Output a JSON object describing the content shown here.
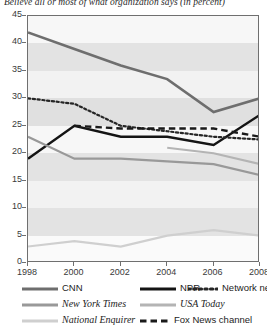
{
  "chart_data": {
    "type": "line",
    "title": "Believe all or most of what organization says (in percent)",
    "xlabel": "",
    "ylabel": "",
    "x": [
      1998,
      2000,
      2002,
      2004,
      2006,
      2008
    ],
    "xticklabels": [
      "1998",
      "2000",
      "2002",
      "2004",
      "2006",
      "2008"
    ],
    "yticklabels": [
      "0",
      "5",
      "10",
      "15",
      "20",
      "25",
      "30",
      "35",
      "40",
      "45"
    ],
    "ylim": [
      0,
      45
    ],
    "ytick_step": 5,
    "grid": "horizontal alternating gray bands",
    "legend_position": "below plot",
    "series": [
      {
        "name": "CNN",
        "color": "#6e6e6e",
        "style": "solid",
        "width": 2.6,
        "x": [
          1998,
          2000,
          2002,
          2004,
          2006,
          2008
        ],
        "values": [
          42,
          39,
          36,
          33.5,
          27.5,
          30
        ]
      },
      {
        "name": "NPR",
        "color": "#141414",
        "style": "solid",
        "width": 2.4,
        "x": [
          1998,
          2000,
          2002,
          2004,
          2006,
          2008
        ],
        "values": [
          19,
          25,
          23,
          23,
          21.5,
          27
        ]
      },
      {
        "name": "Network news",
        "color": "#262626",
        "style": "dotted",
        "width": 2.2,
        "x": [
          1998,
          2000,
          2002,
          2004,
          2006,
          2008
        ],
        "values": [
          30,
          29,
          25,
          24,
          23,
          22.5
        ]
      },
      {
        "name": "New York Times",
        "color": "#999999",
        "style": "solid",
        "width": 2.2,
        "x": [
          1998,
          2000,
          2002,
          2004,
          2006,
          2008
        ],
        "values": [
          23,
          19,
          19,
          18.5,
          18,
          16
        ]
      },
      {
        "name": "USA Today",
        "color": "#b4b4b4",
        "style": "solid",
        "width": 2.2,
        "x": [
          2004,
          2006,
          2008
        ],
        "values": [
          21,
          20,
          18
        ]
      },
      {
        "name": "National Enquirer",
        "color": "#cfcfcf",
        "style": "solid",
        "width": 2.2,
        "x": [
          1998,
          2000,
          2002,
          2004,
          2006,
          2008
        ],
        "values": [
          3,
          4,
          3,
          5,
          6,
          5
        ]
      },
      {
        "name": "Fox News channel",
        "color": "#1a1a1a",
        "style": "dashed",
        "width": 2.4,
        "x": [
          2000,
          2002,
          2004,
          2006,
          2008
        ],
        "values": [
          25,
          24.5,
          24.5,
          24.5,
          23
        ]
      }
    ],
    "bands": [
      {
        "from": 0,
        "to": 5,
        "shade": "#fafafa"
      },
      {
        "from": 5,
        "to": 10,
        "shade": "#e3e3e3"
      },
      {
        "from": 10,
        "to": 15,
        "shade": "#f2f2f2"
      },
      {
        "from": 15,
        "to": 20,
        "shade": "#e3e3e3"
      },
      {
        "from": 20,
        "to": 25,
        "shade": "#f7f7f7"
      },
      {
        "from": 25,
        "to": 30,
        "shade": "#e0e0e0"
      },
      {
        "from": 30,
        "to": 35,
        "shade": "#f2f2f2"
      },
      {
        "from": 35,
        "to": 40,
        "shade": "#e3e3e3"
      },
      {
        "from": 40,
        "to": 45,
        "shade": "#f7f7f7"
      }
    ]
  },
  "legend": {
    "entries": [
      {
        "label": "CNN",
        "style": "solid",
        "color": "#6e6e6e",
        "italic": false
      },
      {
        "label": "NPR",
        "style": "solid",
        "color": "#141414",
        "italic": false
      },
      {
        "label": "Network news",
        "style": "dotted",
        "color": "#262626",
        "italic": false
      },
      {
        "label": "New York Times",
        "style": "solid",
        "color": "#999999",
        "italic": true
      },
      {
        "label": "USA Today",
        "style": "solid",
        "color": "#b4b4b4",
        "italic": true
      },
      {
        "label": "National Enquirer",
        "style": "solid",
        "color": "#cfcfcf",
        "italic": true
      },
      {
        "label": "Fox News channel",
        "style": "dashed",
        "color": "#1a1a1a",
        "italic": false
      }
    ]
  }
}
